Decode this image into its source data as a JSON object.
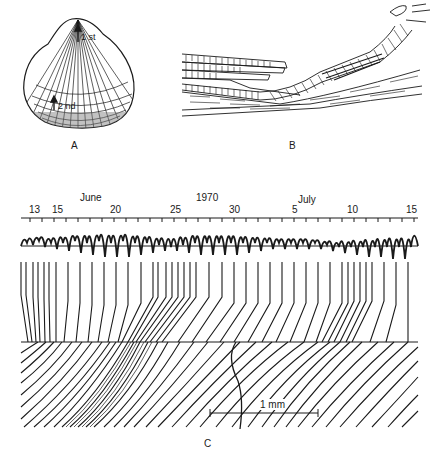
{
  "panels": {
    "a": {
      "label": "A",
      "annotations": {
        "first": "1 st",
        "second": "2 nd"
      }
    },
    "b": {
      "label": "B"
    },
    "c": {
      "label": "C",
      "year": "1970",
      "months": [
        {
          "name": "June"
        },
        {
          "name": "July"
        }
      ],
      "day_ticks": [
        {
          "label": "13",
          "x": 36
        },
        {
          "label": "15",
          "x": 59
        },
        {
          "label": "20",
          "x": 117
        },
        {
          "label": "25",
          "x": 177
        },
        {
          "label": "30",
          "x": 236
        },
        {
          "label": "5",
          "x": 295
        },
        {
          "label": "10",
          "x": 354
        },
        {
          "label": "15",
          "x": 413
        }
      ],
      "scale_bar": {
        "label": "1 mm"
      }
    }
  },
  "colors": {
    "ink": "#1a1a1a",
    "background": "#ffffff"
  }
}
